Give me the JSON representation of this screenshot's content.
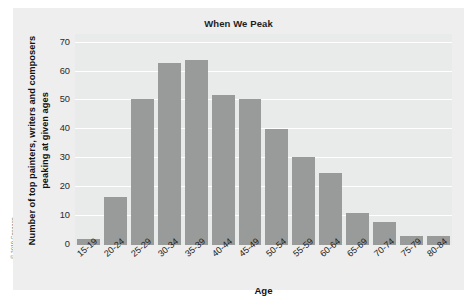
{
  "figure": {
    "copyright": "© 2019 Cengage",
    "panel_bg": "#eeeeee",
    "plot_bg": "#e9eaea",
    "bar_color": "#999a9a",
    "grid_color": "#ffffff"
  },
  "chart_data": {
    "type": "bar",
    "title": "When We Peak",
    "xlabel": "Age",
    "ylabel": "Number of top painters, writers and composers peaking at given ages",
    "categories": [
      "15-19",
      "20-24",
      "25-29",
      "30-34",
      "35-39",
      "40-44",
      "45-49",
      "50-54",
      "55-59",
      "60-64",
      "65-69",
      "70-74",
      "75-79",
      "80-84"
    ],
    "values": [
      2,
      16.5,
      50.5,
      63,
      64,
      52,
      50.5,
      40,
      30.5,
      25,
      11,
      8,
      3,
      3
    ],
    "yticks": [
      0,
      10,
      20,
      30,
      40,
      50,
      60,
      70
    ],
    "ylim": [
      0,
      73
    ],
    "grid": true,
    "legend": "none"
  }
}
